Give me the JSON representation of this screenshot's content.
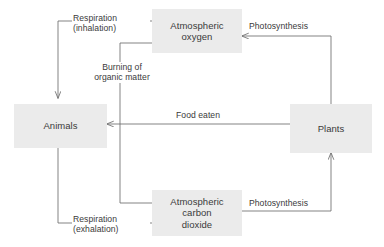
{
  "diagram": {
    "colors": {
      "box_fill": "#ebebeb",
      "line": "#6e6e6e",
      "text": "#3a3a3a",
      "background": "#ffffff"
    },
    "nodes": [
      {
        "id": "atmospheric-oxygen",
        "label": "Atmospheric\noxygen"
      },
      {
        "id": "animals",
        "label": "Animals"
      },
      {
        "id": "plants",
        "label": "Plants"
      },
      {
        "id": "atmospheric-carbon-dioxide",
        "label": "Atmospheric\ncarbon\ndioxide"
      }
    ],
    "edges": [
      {
        "id": "respiration-inhalation",
        "label": "Respiration\n(inhalation)",
        "from": "atmospheric-oxygen",
        "to": "animals"
      },
      {
        "id": "burning-of-organic-matter",
        "label": "Burning of\norganic matter",
        "from": "atmospheric-oxygen",
        "to": "atmospheric-carbon-dioxide"
      },
      {
        "id": "photosynthesis-oxygen",
        "label": "Photosynthesis",
        "from": "plants",
        "to": "atmospheric-oxygen"
      },
      {
        "id": "food-eaten",
        "label": "Food eaten",
        "from": "plants",
        "to": "animals"
      },
      {
        "id": "respiration-exhalation",
        "label": "Respiration\n(exhalation)",
        "from": "animals",
        "to": "atmospheric-carbon-dioxide"
      },
      {
        "id": "photosynthesis-carbon-dioxide",
        "label": "Photosynthesis",
        "from": "atmospheric-carbon-dioxide",
        "to": "plants"
      }
    ]
  }
}
